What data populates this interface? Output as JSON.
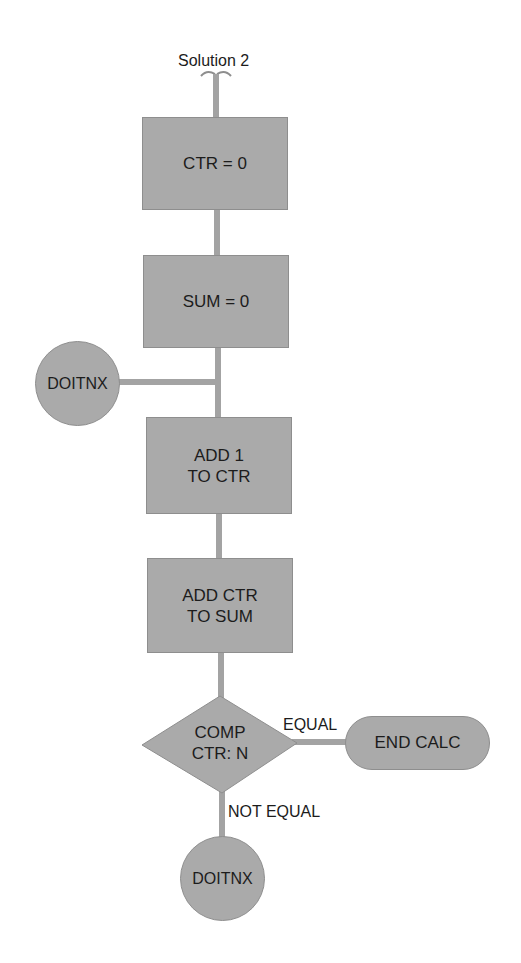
{
  "diagram": {
    "title": "Solution 2",
    "type": "flowchart",
    "nodes": [
      {
        "id": "ctr_init",
        "shape": "process",
        "lines": [
          "CTR = 0"
        ]
      },
      {
        "id": "sum_init",
        "shape": "process",
        "lines": [
          "SUM = 0"
        ]
      },
      {
        "id": "doitnx_entry",
        "shape": "connector",
        "lines": [
          "DOITNX"
        ]
      },
      {
        "id": "add_ctr",
        "shape": "process",
        "lines": [
          "ADD 1",
          "TO CTR"
        ]
      },
      {
        "id": "add_sum",
        "shape": "process",
        "lines": [
          "ADD CTR",
          "TO SUM"
        ]
      },
      {
        "id": "compare",
        "shape": "decision",
        "lines": [
          "COMP",
          "CTR: N"
        ]
      },
      {
        "id": "end_calc",
        "shape": "terminal",
        "lines": [
          "END CALC"
        ]
      },
      {
        "id": "doitnx_exit",
        "shape": "connector",
        "lines": [
          "DOITNX"
        ]
      }
    ],
    "edges": [
      {
        "from": "start",
        "to": "ctr_init",
        "label": ""
      },
      {
        "from": "ctr_init",
        "to": "sum_init",
        "label": ""
      },
      {
        "from": "sum_init",
        "to": "add_ctr",
        "label": ""
      },
      {
        "from": "doitnx_entry",
        "to": "add_ctr",
        "label": ""
      },
      {
        "from": "add_ctr",
        "to": "add_sum",
        "label": ""
      },
      {
        "from": "add_sum",
        "to": "compare",
        "label": ""
      },
      {
        "from": "compare",
        "to": "end_calc",
        "label": "EQUAL"
      },
      {
        "from": "compare",
        "to": "doitnx_exit",
        "label": "NOT EQUAL"
      }
    ],
    "edge_labels": {
      "equal": "EQUAL",
      "not_equal": "NOT EQUAL"
    },
    "colors": {
      "node_fill": "#aaaaaa",
      "node_border": "#8e8e8e",
      "connector_line": "#a3a3a3",
      "text": "#1c1c1c"
    }
  }
}
